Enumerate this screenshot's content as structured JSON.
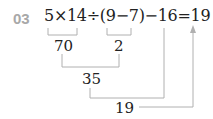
{
  "problem": {
    "number": "03",
    "expression": "5×14÷(9−7)−16=19",
    "steps": [
      {
        "label": "70",
        "from": "5×14"
      },
      {
        "label": "2",
        "from": "9−7"
      },
      {
        "label": "35",
        "from": "70÷2"
      },
      {
        "label": "19",
        "from": "35−16"
      }
    ]
  },
  "colors": {
    "line": "#b0b0b0",
    "number": "#a8a8a8",
    "text": "#222222"
  }
}
